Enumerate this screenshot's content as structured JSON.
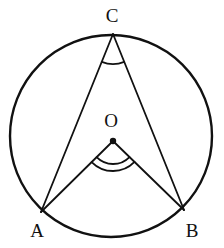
{
  "figure": {
    "background_color": "#ffffff",
    "stroke_color": "#111111",
    "width": 224,
    "height": 248
  },
  "labels": {
    "c": "C",
    "o": "O",
    "a": "A",
    "b": "B"
  },
  "chart_data": {
    "type": "diagram",
    "circle": {
      "center_x": 111,
      "center_y": 136,
      "radius": 101,
      "stroke": "#111111",
      "stroke_width": 2.4,
      "fill": "none"
    },
    "points": [
      {
        "name": "C",
        "x": 113,
        "y": 34,
        "label": "C",
        "label_x": 112,
        "label_y": 15,
        "marker": "none"
      },
      {
        "name": "O",
        "x": 113,
        "y": 141,
        "label": "O",
        "label_x": 111,
        "label_y": 120,
        "marker": "dot"
      },
      {
        "name": "A",
        "x": 41,
        "y": 212,
        "label": "A",
        "label_x": 37,
        "label_y": 230,
        "marker": "none"
      },
      {
        "name": "B",
        "x": 184,
        "y": 210,
        "label": "B",
        "label_x": 192,
        "label_y": 230,
        "marker": "none"
      }
    ],
    "segments": [
      {
        "name": "CA",
        "from": "C",
        "to": "A",
        "x1": 113,
        "y1": 34,
        "x2": 41,
        "y2": 212
      },
      {
        "name": "CB",
        "from": "C",
        "to": "B",
        "x1": 113,
        "y1": 34,
        "x2": 184,
        "y2": 210
      },
      {
        "name": "OA",
        "from": "O",
        "to": "A",
        "x1": 113,
        "y1": 141,
        "x2": 41,
        "y2": 212
      },
      {
        "name": "OB",
        "from": "O",
        "to": "B",
        "x1": 113,
        "y1": 141,
        "x2": 184,
        "y2": 210
      }
    ],
    "angle_marks": [
      {
        "name": "angle-C",
        "vertex": "C",
        "arcs": 1,
        "radii": [
          30
        ],
        "note": "inscribed angle ACB"
      },
      {
        "name": "angle-O",
        "vertex": "O",
        "arcs": 2,
        "radii": [
          23,
          30
        ],
        "note": "central angle AOB"
      }
    ],
    "center_dot": {
      "x": 113,
      "y": 141,
      "r": 3.2,
      "fill": "#111111"
    }
  }
}
